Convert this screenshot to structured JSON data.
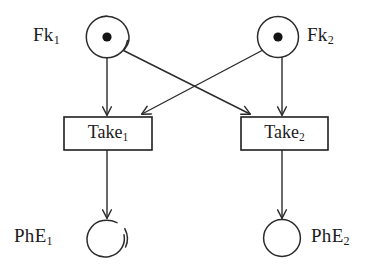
{
  "diagram": {
    "type": "petri-net",
    "stroke_color": "#2b2b2b",
    "fill_color": "#ffffff",
    "token_color": "#141414",
    "background": "#ffffff"
  },
  "places": [
    {
      "id": "fk1",
      "label_text": "Fk",
      "label_sub": "1",
      "tokens": 1,
      "cx": 107,
      "cy": 37,
      "r": 21,
      "style": "sketchy-broken",
      "label_x": 33,
      "label_y": 24
    },
    {
      "id": "fk2",
      "label_text": "Fk",
      "label_sub": "2",
      "tokens": 1,
      "cx": 278,
      "cy": 37,
      "r": 20,
      "style": "solid",
      "label_x": 307,
      "label_y": 24
    },
    {
      "id": "phe1",
      "label_text": "PhE",
      "label_sub": "1",
      "tokens": 0,
      "cx": 107,
      "cy": 238,
      "r": 18,
      "style": "sketchy-broken",
      "label_x": 14,
      "label_y": 225
    },
    {
      "id": "phe2",
      "label_text": "PhE",
      "label_sub": "2",
      "tokens": 0,
      "cx": 282,
      "cy": 238,
      "r": 18,
      "style": "solid",
      "label_x": 311,
      "label_y": 225
    }
  ],
  "transitions": [
    {
      "id": "take1",
      "label_text": "Take",
      "label_sub": "1",
      "x": 64,
      "y": 117,
      "width": 88,
      "height": 33
    },
    {
      "id": "take2",
      "label_text": "Take",
      "label_sub": "2",
      "x": 241,
      "y": 117,
      "width": 87,
      "height": 33
    }
  ],
  "arcs": [
    {
      "id": "fk1-take1",
      "from": "fk1",
      "to": "take1",
      "kind": "vertical"
    },
    {
      "id": "fk1-take2",
      "from": "fk1",
      "to": "take2",
      "kind": "diagonal"
    },
    {
      "id": "fk2-take1",
      "from": "fk2",
      "to": "take1",
      "kind": "diagonal"
    },
    {
      "id": "fk2-take2",
      "from": "fk2",
      "to": "take2",
      "kind": "vertical"
    },
    {
      "id": "take1-phe1",
      "from": "take1",
      "to": "phe1",
      "kind": "vertical"
    },
    {
      "id": "take2-phe2",
      "from": "take2",
      "to": "phe2",
      "kind": "vertical"
    }
  ]
}
